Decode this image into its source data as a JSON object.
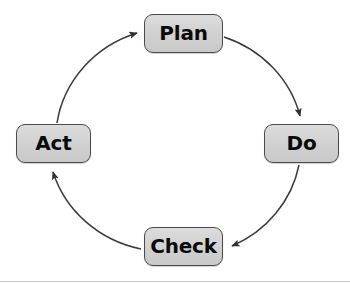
{
  "diagram": {
    "type": "cycle-diagram",
    "direction": "clockwise",
    "colors": {
      "node_fill": "#d2d2d2",
      "node_border": "#4a4a4a",
      "label_text": "#0a0a0a",
      "arrow_stroke": "#3a3a3a",
      "background": "#ffffff"
    },
    "nodes": [
      {
        "id": "plan",
        "label": "Plan",
        "position": "top"
      },
      {
        "id": "do",
        "label": "Do",
        "position": "right"
      },
      {
        "id": "check",
        "label": "Check",
        "position": "bottom"
      },
      {
        "id": "act",
        "label": "Act",
        "position": "left"
      }
    ],
    "connectors": [
      {
        "id": "act-to-plan",
        "from": "act",
        "to": "plan",
        "arrowhead": "at-plan-left"
      },
      {
        "id": "plan-to-do",
        "from": "plan",
        "to": "do",
        "arrowhead": "at-do-top"
      },
      {
        "id": "do-to-check",
        "from": "do",
        "to": "check",
        "arrowhead": "at-check-right"
      },
      {
        "id": "check-to-act",
        "from": "check",
        "to": "act",
        "arrowhead": "at-act-bottom"
      }
    ]
  }
}
